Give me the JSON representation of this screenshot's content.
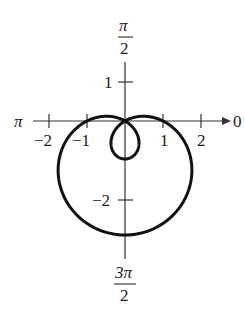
{
  "chart_data": {
    "type": "line",
    "coordinate_system": "polar",
    "title": "",
    "equation": "r = 1 - 2 sin(theta)",
    "curve": "limacon with inner loop",
    "angle_labels": {
      "right": "0",
      "top": {
        "num": "π",
        "den": "2"
      },
      "left": "π",
      "bottom": {
        "num": "3π",
        "den": "2"
      }
    },
    "x_ticks": [
      -2,
      -1,
      1,
      2
    ],
    "x_tick_labels": [
      "−2",
      "−1",
      "1",
      "2"
    ],
    "y_ticks": [
      1,
      -2
    ],
    "y_tick_labels": [
      "1",
      "−2"
    ],
    "key_points": [
      {
        "theta": "0",
        "r": 1
      },
      {
        "theta": "π/2",
        "r": -1
      },
      {
        "theta": "π",
        "r": 1
      },
      {
        "theta": "3π/2",
        "r": 3
      }
    ],
    "xlim": [
      -2.5,
      2.5
    ],
    "ylim": [
      -3.5,
      1.5
    ],
    "grid": false,
    "legend": null
  },
  "colors": {
    "curve": "#111111",
    "axes": "#333333",
    "background": "#ffffff"
  }
}
